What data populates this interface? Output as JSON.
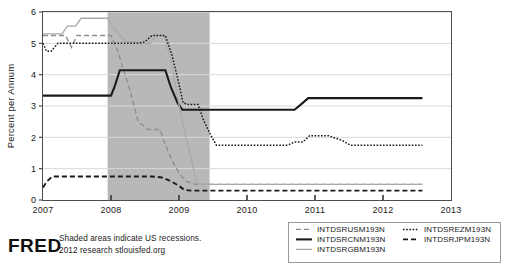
{
  "chart_data": {
    "type": "line",
    "title": "",
    "xlabel": "",
    "ylabel": "Percent per Annum",
    "xlim": [
      2007.0,
      2013.0
    ],
    "ylim": [
      0,
      6
    ],
    "yticks": [
      0,
      1,
      2,
      3,
      4,
      5,
      6
    ],
    "xticks": [
      2007,
      2008,
      2009,
      2010,
      2011,
      2012,
      2013
    ],
    "ytick_labels": [
      "0",
      "1",
      "2",
      "3",
      "4",
      "5",
      "6"
    ],
    "xtick_labels": [
      "2007",
      "2008",
      "2009",
      "2010",
      "2011",
      "2012",
      "2013"
    ],
    "grid": true,
    "legend_position": "bottom-right",
    "shaded_regions": [
      {
        "label": "US recession",
        "x_start": 2007.95,
        "x_end": 2009.45,
        "color": "#b8b8b8"
      }
    ],
    "series": [
      {
        "name": "INTDSRUSM193N",
        "style": "dashed",
        "color": "#8c8c8c",
        "points": [
          [
            2007.0,
            5.25
          ],
          [
            2007.33,
            5.25
          ],
          [
            2007.42,
            4.87
          ],
          [
            2007.5,
            5.25
          ],
          [
            2007.75,
            5.25
          ],
          [
            2008.0,
            5.25
          ],
          [
            2008.1,
            4.75
          ],
          [
            2008.17,
            4.25
          ],
          [
            2008.28,
            3.5
          ],
          [
            2008.4,
            2.5
          ],
          [
            2008.55,
            2.25
          ],
          [
            2008.72,
            2.25
          ],
          [
            2008.8,
            1.75
          ],
          [
            2008.9,
            1.25
          ],
          [
            2009.0,
            0.86
          ],
          [
            2009.1,
            0.6
          ],
          [
            2009.25,
            0.5
          ],
          [
            2009.45,
            0.5
          ],
          [
            2010.0,
            0.5
          ],
          [
            2011.0,
            0.5
          ],
          [
            2012.0,
            0.5
          ],
          [
            2012.58,
            0.5
          ]
        ]
      },
      {
        "name": "INTDSRCNM193N",
        "style": "solid",
        "color": "#1a1a1a",
        "points": [
          [
            2007.0,
            3.33
          ],
          [
            2007.5,
            3.33
          ],
          [
            2008.0,
            3.33
          ],
          [
            2008.05,
            3.6
          ],
          [
            2008.13,
            4.14
          ],
          [
            2008.3,
            4.14
          ],
          [
            2008.6,
            4.14
          ],
          [
            2008.8,
            4.14
          ],
          [
            2008.88,
            3.6
          ],
          [
            2008.98,
            3.1
          ],
          [
            2009.05,
            2.88
          ],
          [
            2009.45,
            2.88
          ],
          [
            2010.0,
            2.88
          ],
          [
            2010.7,
            2.88
          ],
          [
            2010.82,
            3.1
          ],
          [
            2010.9,
            3.25
          ],
          [
            2011.5,
            3.25
          ],
          [
            2012.0,
            3.25
          ],
          [
            2012.58,
            3.25
          ]
        ]
      },
      {
        "name": "INTDSRGBM193N",
        "style": "solid-light",
        "color": "#a9a9a9",
        "points": [
          [
            2007.0,
            5.3
          ],
          [
            2007.28,
            5.3
          ],
          [
            2007.36,
            5.55
          ],
          [
            2007.48,
            5.55
          ],
          [
            2007.56,
            5.8
          ],
          [
            2007.8,
            5.8
          ],
          [
            2007.95,
            5.8
          ],
          [
            2008.02,
            5.55
          ],
          [
            2008.13,
            5.25
          ],
          [
            2008.22,
            5.05
          ],
          [
            2008.32,
            5.05
          ],
          [
            2008.45,
            5.0
          ],
          [
            2008.58,
            5.0
          ],
          [
            2008.66,
            5.25
          ],
          [
            2008.78,
            5.25
          ],
          [
            2008.88,
            4.5
          ],
          [
            2008.96,
            3.5
          ],
          [
            2009.06,
            2.4
          ],
          [
            2009.16,
            1.5
          ],
          [
            2009.26,
            0.55
          ],
          [
            2009.36,
            0.5
          ],
          [
            2009.45,
            0.5
          ],
          [
            2010.0,
            0.5
          ],
          [
            2011.0,
            0.5
          ],
          [
            2012.0,
            0.5
          ],
          [
            2012.58,
            0.5
          ]
        ]
      },
      {
        "name": "INTDSREZM193N",
        "style": "dotted",
        "color": "#1a1a1a",
        "points": [
          [
            2007.0,
            5.0
          ],
          [
            2007.05,
            4.75
          ],
          [
            2007.12,
            4.75
          ],
          [
            2007.22,
            5.0
          ],
          [
            2007.5,
            5.0
          ],
          [
            2008.0,
            5.0
          ],
          [
            2008.4,
            5.0
          ],
          [
            2008.5,
            5.05
          ],
          [
            2008.6,
            5.25
          ],
          [
            2008.8,
            5.25
          ],
          [
            2008.9,
            4.6
          ],
          [
            2009.0,
            3.7
          ],
          [
            2009.06,
            3.1
          ],
          [
            2009.14,
            3.05
          ],
          [
            2009.28,
            3.05
          ],
          [
            2009.36,
            2.55
          ],
          [
            2009.46,
            2.1
          ],
          [
            2009.55,
            1.75
          ],
          [
            2010.0,
            1.75
          ],
          [
            2010.6,
            1.75
          ],
          [
            2010.7,
            1.85
          ],
          [
            2010.82,
            1.85
          ],
          [
            2010.92,
            2.05
          ],
          [
            2011.2,
            2.05
          ],
          [
            2011.4,
            1.9
          ],
          [
            2011.52,
            1.75
          ],
          [
            2012.0,
            1.75
          ],
          [
            2012.58,
            1.75
          ]
        ]
      },
      {
        "name": "INTDSRJPM193N",
        "style": "dashed-bold",
        "color": "#1a1a1a",
        "points": [
          [
            2007.0,
            0.4
          ],
          [
            2007.06,
            0.6
          ],
          [
            2007.14,
            0.75
          ],
          [
            2007.5,
            0.75
          ],
          [
            2008.0,
            0.75
          ],
          [
            2008.6,
            0.75
          ],
          [
            2008.75,
            0.72
          ],
          [
            2008.88,
            0.6
          ],
          [
            2009.0,
            0.45
          ],
          [
            2009.08,
            0.32
          ],
          [
            2009.18,
            0.3
          ],
          [
            2009.45,
            0.3
          ],
          [
            2010.0,
            0.3
          ],
          [
            2011.0,
            0.3
          ],
          [
            2012.0,
            0.3
          ],
          [
            2012.58,
            0.3
          ]
        ]
      }
    ]
  },
  "legend": {
    "entries": [
      {
        "label": "INTDSRUSM193N",
        "style": "dashed",
        "color": "#8c8c8c",
        "column": 0
      },
      {
        "label": "INTDSRCNM193N",
        "style": "solid",
        "color": "#1a1a1a",
        "column": 0
      },
      {
        "label": "INTDSRGBM193N",
        "style": "solid-light",
        "color": "#a9a9a9",
        "column": 0
      },
      {
        "label": "INTDSREZM193N",
        "style": "dotted",
        "color": "#1a1a1a",
        "column": 1
      },
      {
        "label": "INTDSRJPM193N",
        "style": "dashed-bold",
        "color": "#1a1a1a",
        "column": 1
      }
    ]
  },
  "branding": {
    "wordmark": "FRED",
    "footnote_line1": "Shaded areas indicate US recessions.",
    "footnote_line2": "2012 research stlouisfed.org"
  },
  "colors": {
    "background": "#ffffff",
    "axis": "#4d4d4d",
    "grid": "#d9d9d9",
    "recession_shade": "#b8b8b8",
    "text": "#1a1a1a"
  }
}
